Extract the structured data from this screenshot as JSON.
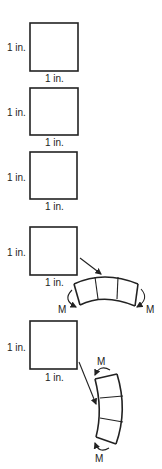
{
  "diagram": {
    "squares": [
      {
        "side_label": "1 in.",
        "bottom_label": "1 in."
      },
      {
        "side_label": "1 in.",
        "bottom_label": "1 in."
      },
      {
        "side_label": "1 in.",
        "bottom_label": "1 in."
      },
      {
        "side_label": "1 in.",
        "bottom_label": "1 in."
      },
      {
        "side_label": "1 in.",
        "bottom_label": "1 in."
      }
    ],
    "bent_horizontal": {
      "moment_left": "M",
      "moment_right": "M"
    },
    "bent_vertical": {
      "moment_top": "M",
      "moment_bottom": "M"
    }
  },
  "colors": {
    "stroke": "#222222",
    "background": "#ffffff"
  }
}
